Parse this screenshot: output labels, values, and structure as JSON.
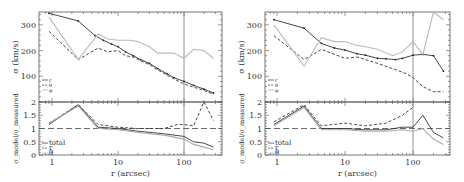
{
  "chart_data": [
    {
      "type": "line",
      "panel": "left",
      "subplots": [
        {
          "name": "dispersion",
          "ylabel": "σ (km/s)",
          "ylim": [
            0,
            350
          ],
          "yticks": [
            100,
            200,
            300
          ],
          "xscale": "log",
          "xlim": [
            0.7,
            330
          ],
          "vline_x": 100,
          "legend": [
            "r",
            "θ",
            "φ"
          ],
          "series": [
            {
              "name": "r",
              "style": "solid-points",
              "color": "#333333",
              "x": [
                0.9,
                2.5,
                4.5,
                6,
                8,
                10,
                13,
                17,
                22,
                30,
                40,
                55,
                70,
                100,
                140,
                200,
                280
              ],
              "y": [
                345,
                315,
                258,
                240,
                225,
                215,
                195,
                180,
                165,
                150,
                130,
                110,
                95,
                80,
                65,
                50,
                35
              ]
            },
            {
              "name": "θ",
              "style": "dashed",
              "color": "#333333",
              "x": [
                0.9,
                2.5,
                5,
                7,
                10,
                13,
                17,
                22,
                30,
                40,
                55,
                70,
                100,
                140,
                200,
                280
              ],
              "y": [
                275,
                165,
                210,
                195,
                200,
                180,
                175,
                160,
                145,
                125,
                105,
                90,
                70,
                58,
                45,
                30
              ]
            },
            {
              "name": "φ",
              "style": "solid-light",
              "color": "#bbbbbb",
              "x": [
                0.9,
                2.5,
                5,
                7,
                10,
                15,
                20,
                30,
                40,
                55,
                70,
                100,
                140,
                200,
                280
              ],
              "y": [
                330,
                165,
                265,
                245,
                240,
                240,
                235,
                215,
                190,
                190,
                190,
                170,
                205,
                200,
                170
              ]
            }
          ]
        },
        {
          "name": "ratio",
          "ylabel": "σ_model / σ_measured",
          "ylim": [
            0,
            2
          ],
          "yticks": [
            0,
            0.5,
            1,
            1.5,
            2
          ],
          "hline_y": 1,
          "legend": [
            "total",
            "r",
            "θ"
          ],
          "xticks": [
            1,
            10,
            100
          ],
          "xlabel": "r (arcsec)",
          "series": [
            {
              "name": "total",
              "style": "solid",
              "color": "#333333",
              "x": [
                0.9,
                2.5,
                5,
                10,
                20,
                50,
                100,
                140,
                200,
                280
              ],
              "y": [
                1.15,
                1.9,
                1.05,
                1.0,
                0.9,
                0.8,
                0.7,
                0.5,
                0.45,
                0.3
              ]
            },
            {
              "name": "θ",
              "style": "dashed",
              "color": "#333333",
              "x": [
                0.9,
                2.5,
                5,
                10,
                20,
                50,
                80,
                100,
                140,
                200,
                280
              ],
              "y": [
                1.2,
                1.9,
                1.15,
                1.05,
                1.0,
                1.0,
                1.15,
                1.15,
                1.1,
                2.0,
                1.3
              ]
            },
            {
              "name": "r",
              "style": "solid-light",
              "color": "#aaaaaa",
              "x": [
                0.9,
                2.5,
                5,
                10,
                20,
                50,
                100,
                140,
                200,
                280
              ],
              "y": [
                1.2,
                1.85,
                1.0,
                0.95,
                0.85,
                0.75,
                0.6,
                0.4,
                0.3,
                0.2
              ]
            }
          ]
        }
      ]
    },
    {
      "type": "line",
      "panel": "right",
      "subplots": [
        {
          "name": "dispersion",
          "ylabel": "σ (km/s)",
          "ylim": [
            0,
            350
          ],
          "yticks": [
            100,
            200,
            300
          ],
          "xscale": "log",
          "xlim": [
            0.7,
            330
          ],
          "vline_x": 100,
          "legend": [
            "r",
            "θ",
            "φ"
          ],
          "series": [
            {
              "name": "r",
              "style": "solid-points",
              "color": "#333333",
              "x": [
                0.9,
                2.5,
                4.5,
                7,
                10,
                15,
                20,
                30,
                40,
                55,
                70,
                100,
                140,
                200,
                280
              ],
              "y": [
                320,
                287,
                228,
                210,
                202,
                188,
                182,
                170,
                168,
                165,
                170,
                182,
                185,
                180,
                120
              ]
            },
            {
              "name": "θ",
              "style": "dashed",
              "color": "#333333",
              "x": [
                0.9,
                2.5,
                4.5,
                7,
                10,
                15,
                20,
                30,
                50,
                80,
                100,
                140,
                200,
                280
              ],
              "y": [
                258,
                165,
                205,
                185,
                170,
                175,
                165,
                150,
                130,
                110,
                95,
                60,
                40,
                40
              ]
            },
            {
              "name": "φ",
              "style": "solid-light",
              "color": "#bbbbbb",
              "x": [
                0.9,
                2.5,
                4.5,
                7,
                10,
                15,
                20,
                30,
                50,
                70,
                100,
                140,
                200,
                280
              ],
              "y": [
                300,
                140,
                250,
                235,
                235,
                220,
                215,
                205,
                180,
                195,
                235,
                185,
                350,
                320
              ]
            }
          ]
        },
        {
          "name": "ratio",
          "ylabel": "σ_model / σ_measured",
          "ylim": [
            0,
            2
          ],
          "yticks": [
            0,
            0.5,
            1,
            1.5,
            2
          ],
          "hline_y": 1,
          "legend": [
            "total",
            "r",
            "θ"
          ],
          "xticks": [
            1,
            10,
            100
          ],
          "xlabel": "r (arcsec)",
          "series": [
            {
              "name": "total",
              "style": "solid",
              "color": "#333333",
              "x": [
                0.9,
                2.5,
                4.5,
                10,
                20,
                40,
                70,
                100,
                140,
                200,
                280
              ],
              "y": [
                1.15,
                1.85,
                1.0,
                1.0,
                0.95,
                0.95,
                1.05,
                1.05,
                1.5,
                0.85,
                0.65
              ]
            },
            {
              "name": "θ",
              "style": "dashed",
              "color": "#333333",
              "x": [
                0.9,
                2.5,
                4.5,
                10,
                20,
                40,
                70,
                100
              ],
              "y": [
                1.25,
                1.9,
                1.1,
                1.2,
                1.1,
                1.2,
                1.5,
                1.8
              ]
            },
            {
              "name": "r",
              "style": "solid-light",
              "color": "#aaaaaa",
              "x": [
                0.9,
                2.5,
                4.5,
                10,
                20,
                40,
                70,
                100,
                140,
                200,
                280
              ],
              "y": [
                1.1,
                1.8,
                0.95,
                0.95,
                0.9,
                0.9,
                0.95,
                0.9,
                1.0,
                0.6,
                0.4
              ]
            }
          ]
        }
      ]
    }
  ],
  "labels": {
    "xlabel": "r (arcsec)",
    "ylabel_top": "σ (km/s)",
    "ylabel_bottom": "σ_model/σ_measured",
    "legend_top": [
      "r",
      "θ",
      "φ"
    ],
    "legend_bottom": [
      "total",
      "r",
      "θ"
    ],
    "xtick_labels": [
      "1",
      "10",
      "100"
    ],
    "ytick_top": [
      "100",
      "200",
      "300"
    ],
    "ytick_bottom": [
      "0",
      "0.5",
      "1",
      "1.5",
      "2"
    ]
  }
}
